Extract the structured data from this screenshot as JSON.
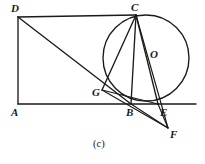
{
  "figure": {
    "caption": "(c)",
    "caption_position": {
      "x": 93,
      "y": 139
    },
    "canvas": {
      "width": 205,
      "height": 164
    },
    "colors": {
      "ink": "#1a1a1a",
      "background": "#ffffff"
    },
    "points": [
      {
        "id": "A",
        "label": "A",
        "x": 18,
        "y": 104,
        "label_x": 11,
        "label_y": 107,
        "role": "rectangle-corner-bottom-left"
      },
      {
        "id": "B",
        "label": "B",
        "x": 131,
        "y": 104,
        "label_x": 126,
        "label_y": 107,
        "role": "rectangle-corner-bottom-right-on-circle"
      },
      {
        "id": "C",
        "label": "C",
        "x": 136,
        "y": 15,
        "label_x": 131,
        "label_y": 2,
        "role": "rectangle-corner-top-right-on-circle"
      },
      {
        "id": "D",
        "label": "D",
        "x": 18,
        "y": 17,
        "label_x": 11,
        "label_y": 3,
        "role": "rectangle-corner-top-left"
      },
      {
        "id": "E",
        "label": "E",
        "x": 158,
        "y": 104,
        "label_x": 160,
        "label_y": 107,
        "role": "intersection-on-baseline-and-circle"
      },
      {
        "id": "F",
        "label": "F",
        "x": 168,
        "y": 128,
        "label_x": 170,
        "label_y": 129,
        "role": "external-point-below-baseline"
      },
      {
        "id": "G",
        "label": "G",
        "x": 102,
        "y": 90,
        "label_x": 92,
        "label_y": 87,
        "role": "point-on-circle-left"
      },
      {
        "id": "O",
        "label": "O",
        "x": 146,
        "y": 58,
        "label_x": 150,
        "label_y": 49,
        "role": "circle-center"
      }
    ],
    "circle": {
      "id": "circle-O",
      "center_x": 146,
      "center_y": 58,
      "radius": 43,
      "through": [
        "C",
        "G",
        "B",
        "E"
      ]
    },
    "segments": [
      {
        "id": "seg-DA",
        "from": "D",
        "to": "A",
        "note": "rectangle left side"
      },
      {
        "id": "seg-DC",
        "from": "D",
        "to": "C",
        "note": "rectangle top side"
      },
      {
        "id": "seg-CB",
        "from": "C",
        "to": "B",
        "note": "rectangle right side, chord of circle"
      },
      {
        "id": "seg-DB",
        "from": "D",
        "to": "B",
        "note": "diagonal from D through G to B"
      },
      {
        "id": "seg-CG",
        "from": "C",
        "to": "G",
        "note": "chord"
      },
      {
        "id": "seg-CE",
        "from": "C",
        "to": "E",
        "note": "chord through O region"
      },
      {
        "id": "seg-CF",
        "from": "C",
        "to": "F",
        "note": "line from C to external point F"
      },
      {
        "id": "seg-GE",
        "from": "G",
        "to": "E",
        "note": "chord from G to E"
      },
      {
        "id": "seg-GF",
        "from": "G",
        "to": "F",
        "note": "line from G to F"
      },
      {
        "id": "seg-BE",
        "from": "B",
        "to": "E",
        "note": "on baseline"
      },
      {
        "id": "seg-BF",
        "from": "B",
        "to": "F",
        "note": "line from B down to F"
      },
      {
        "id": "seg-EF",
        "from": "E",
        "to": "F",
        "note": "line from E down to F"
      },
      {
        "id": "seg-baseline",
        "from": "A",
        "to": "baseline-right-end",
        "note": "horizontal line through A, B, E extending right"
      }
    ],
    "baseline": {
      "x1": 18,
      "y1": 104,
      "x2": 196,
      "y2": 104
    }
  }
}
